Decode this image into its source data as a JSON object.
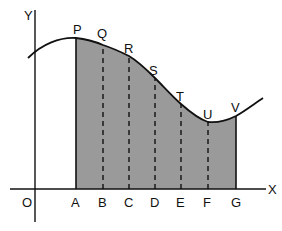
{
  "diagram": {
    "type": "area-under-curve-ordinates",
    "colors": {
      "fill": "#9a9a9a",
      "stroke": "#111111",
      "background": "#ffffff"
    },
    "axes": {
      "y_label": "Y",
      "x_label": "X",
      "origin_label": "O"
    },
    "x_points": [
      {
        "label": "A",
        "x": 76
      },
      {
        "label": "B",
        "x": 103
      },
      {
        "label": "C",
        "x": 129
      },
      {
        "label": "D",
        "x": 155
      },
      {
        "label": "E",
        "x": 181
      },
      {
        "label": "F",
        "x": 208
      },
      {
        "label": "G",
        "x": 236
      }
    ],
    "curve_points": [
      {
        "label": "P",
        "x": 76,
        "y": 38
      },
      {
        "label": "Q",
        "x": 103,
        "y": 45
      },
      {
        "label": "R",
        "x": 129,
        "y": 56
      },
      {
        "label": "S",
        "x": 155,
        "y": 78
      },
      {
        "label": "T",
        "x": 181,
        "y": 104
      },
      {
        "label": "U",
        "x": 208,
        "y": 122
      },
      {
        "label": "V",
        "x": 236,
        "y": 116
      }
    ]
  }
}
